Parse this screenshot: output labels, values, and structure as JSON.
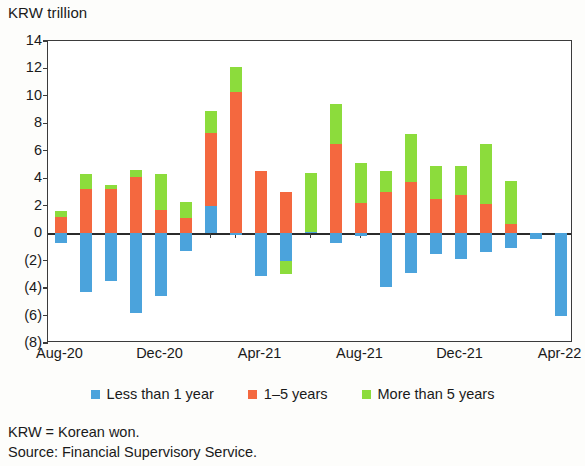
{
  "chart_data": {
    "type": "bar",
    "stacked": true,
    "title": "",
    "unit_label": "KRW trillion",
    "xlabel": "",
    "ylabel": "",
    "ylim": [
      -8,
      14
    ],
    "yticks": [
      14,
      12,
      10,
      8,
      6,
      4,
      2,
      0,
      -2,
      -4,
      -6,
      -8
    ],
    "ytick_labels": [
      "14",
      "12",
      "10",
      "8",
      "6",
      "4",
      "2",
      "0",
      "(2)",
      "(4)",
      "(6)",
      "(8)"
    ],
    "grid": false,
    "legend_position": "bottom",
    "colors": {
      "less_than_1_year": "#4ba3dc",
      "one_to_five_years": "#f4683f",
      "more_than_5_years": "#8cdc3c"
    },
    "categories": [
      "Aug-20",
      "Sep-20",
      "Oct-20",
      "Nov-20",
      "Dec-20",
      "Jan-21",
      "Feb-21",
      "Mar-21",
      "Apr-21",
      "May-21",
      "Jun-21",
      "Jul-21",
      "Aug-21",
      "Sep-21",
      "Oct-21",
      "Nov-21",
      "Dec-21",
      "Jan-22",
      "Feb-22",
      "Mar-22",
      "Apr-22"
    ],
    "xtick_labels": [
      "Aug-20",
      "Dec-20",
      "Apr-21",
      "Aug-21",
      "Dec-21",
      "Apr-22"
    ],
    "xtick_categories": [
      "Aug-20",
      "Dec-20",
      "Apr-21",
      "Aug-21",
      "Dec-21",
      "Apr-22"
    ],
    "series": [
      {
        "name": "Less than 1 year",
        "color": "#4ba3dc",
        "values": [
          -0.7,
          -4.3,
          -3.5,
          -5.8,
          -4.6,
          -1.3,
          2.0,
          -0.1,
          -3.1,
          -2.0,
          0.1,
          -0.7,
          -0.2,
          -3.9,
          -2.9,
          -1.5,
          -1.9,
          -1.4,
          -1.1,
          -0.4,
          -6.0
        ]
      },
      {
        "name": "1-5 years",
        "color": "#f4683f",
        "values": [
          1.2,
          3.2,
          3.2,
          4.1,
          1.7,
          1.1,
          5.3,
          10.3,
          4.5,
          3.0,
          5.1,
          6.5,
          2.2,
          3.0,
          3.7,
          2.5,
          2.8,
          2.1,
          0.7,
          0.0,
          0.0
        ]
      },
      {
        "name": "More than 5 years",
        "color": "#8cdc3c",
        "values": [
          0.4,
          1.1,
          0.3,
          0.5,
          2.6,
          1.2,
          1.6,
          1.8,
          0.0,
          2.3,
          4.3,
          2.9,
          2.9,
          1.5,
          3.5,
          2.4,
          2.1,
          4.4,
          3.1,
          0.0,
          0.0
        ]
      }
    ],
    "negative_overrides": [
      {
        "category": "May-21",
        "series": "More than 5 years",
        "value": -1.0
      },
      {
        "category": "Jun-21",
        "series": "1-5 years",
        "value": 0.0
      }
    ]
  },
  "legend": {
    "items": [
      {
        "label": "Less than 1 year",
        "color": "#4ba3dc"
      },
      {
        "label": "1–5 years",
        "color": "#f4683f"
      },
      {
        "label": "More than 5 years",
        "color": "#8cdc3c"
      }
    ]
  },
  "notes": {
    "abbreviation": "KRW = Korean won.",
    "source": "Source: Financial Supervisory Service."
  }
}
